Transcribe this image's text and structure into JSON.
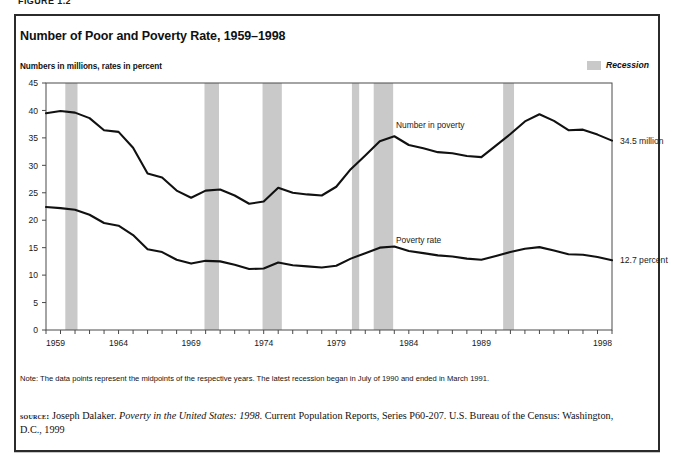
{
  "page": {
    "cut_header": "FIGURE 1.2",
    "title": "Number of Poor and Poverty Rate, 1959–1998",
    "subtitle": "Numbers in millions, rates in percent",
    "note": "Note: The data points represent the midpoints of the respective years. The latest recession began in July of 1990 and ended in March 1991.",
    "source": {
      "kicker": "source:",
      "author": "Joseph Dalaker.",
      "work_italic": "Poverty in the United States: 1998.",
      "rest": "Current Population Reports, Series P60-207. U.S. Bureau of the Census: Washington, D.C., 1999"
    }
  },
  "legend": {
    "recession_label": "Recession",
    "recession_color": "#c9c9c9"
  },
  "colors": {
    "line": "#111111",
    "axis": "#4a4a4a",
    "frame": "#2b2b2b",
    "recession_band": "#c9c9c9",
    "text": "#1a1a1a"
  },
  "chart_data": {
    "type": "line",
    "title": "Number of Poor and Poverty Rate, 1959–1998",
    "subtitle": "Numbers in millions, rates in percent",
    "xlabel": "",
    "ylabel": "Numbers in millions, rates in percent",
    "xlim": [
      1959,
      1998
    ],
    "ylim": [
      0,
      45
    ],
    "yticks": [
      0,
      5,
      10,
      15,
      20,
      25,
      30,
      35,
      40,
      45
    ],
    "ytick_labels": [
      "0",
      "5",
      "10",
      "15",
      "20",
      "25",
      "30",
      "35",
      "40",
      "45"
    ],
    "xticks_labeled": [
      1959,
      1964,
      1969,
      1974,
      1979,
      1984,
      1989,
      1998
    ],
    "xtick_labels": [
      "1959",
      "1964",
      "1969",
      "1974",
      "1979",
      "1984",
      "1989",
      "1998"
    ],
    "xtick_step": 1,
    "grid": false,
    "legend_position": "top-right",
    "x": [
      1959,
      1960,
      1961,
      1962,
      1963,
      1964,
      1965,
      1966,
      1967,
      1968,
      1969,
      1970,
      1971,
      1972,
      1973,
      1974,
      1975,
      1976,
      1977,
      1978,
      1979,
      1980,
      1981,
      1982,
      1983,
      1984,
      1985,
      1986,
      1987,
      1988,
      1989,
      1990,
      1991,
      1992,
      1993,
      1994,
      1995,
      1996,
      1997,
      1998
    ],
    "series": [
      {
        "name": "Number in poverty",
        "units": "millions",
        "annotation": "Number in poverty",
        "end_label": "34.5 million",
        "values": [
          39.5,
          39.9,
          39.6,
          38.6,
          36.4,
          36.1,
          33.2,
          28.5,
          27.8,
          25.4,
          24.1,
          25.4,
          25.6,
          24.5,
          23.0,
          23.4,
          25.9,
          25.0,
          24.7,
          24.5,
          26.1,
          29.3,
          31.8,
          34.4,
          35.3,
          33.7,
          33.1,
          32.4,
          32.2,
          31.7,
          31.5,
          33.6,
          35.7,
          38.0,
          39.3,
          38.1,
          36.4,
          36.5,
          35.6,
          34.5
        ]
      },
      {
        "name": "Poverty rate",
        "units": "percent",
        "annotation": "Poverty rate",
        "end_label": "12.7 percent",
        "values": [
          22.4,
          22.2,
          21.9,
          21.0,
          19.5,
          19.0,
          17.3,
          14.7,
          14.2,
          12.8,
          12.1,
          12.6,
          12.5,
          11.9,
          11.1,
          11.2,
          12.3,
          11.8,
          11.6,
          11.4,
          11.7,
          13.0,
          14.0,
          15.0,
          15.2,
          14.4,
          14.0,
          13.6,
          13.4,
          13.0,
          12.8,
          13.5,
          14.2,
          14.8,
          15.1,
          14.5,
          13.8,
          13.7,
          13.3,
          12.7
        ]
      }
    ],
    "recessions": [
      {
        "start": 1960.33,
        "end": 1961.17,
        "label": "1960-61 recession"
      },
      {
        "start": 1969.92,
        "end": 1970.92,
        "label": "1969-70 recession"
      },
      {
        "start": 1973.92,
        "end": 1975.25,
        "label": "1973-75 recession"
      },
      {
        "start": 1980.08,
        "end": 1980.58,
        "label": "1980 recession"
      },
      {
        "start": 1981.58,
        "end": 1982.92,
        "label": "1981-82 recession"
      },
      {
        "start": 1990.5,
        "end": 1991.25,
        "label": "1990-91 recession"
      }
    ]
  }
}
